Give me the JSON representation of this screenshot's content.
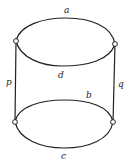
{
  "diagram": {
    "type": "graph",
    "colors": {
      "stroke": "#222222",
      "background": "#ffffff",
      "node_fill": "#ffffff"
    },
    "nodes": [
      {
        "id": "top-left",
        "x": 16,
        "y": 41
      },
      {
        "id": "top-right",
        "x": 115,
        "y": 44
      },
      {
        "id": "bottom-left",
        "x": 15,
        "y": 122
      },
      {
        "id": "bottom-right",
        "x": 113,
        "y": 122
      }
    ],
    "edges": [
      {
        "label": "a",
        "from": "top-left",
        "to": "top-right",
        "kind": "upper arc of top ellipse"
      },
      {
        "label": "d",
        "from": "top-left",
        "to": "top-right",
        "kind": "lower arc of top ellipse"
      },
      {
        "label": "p",
        "from": "top-left",
        "to": "bottom-left",
        "kind": "vertical line"
      },
      {
        "label": "q",
        "from": "top-right",
        "to": "bottom-right",
        "kind": "vertical line"
      },
      {
        "label": "b",
        "from": "bottom-left",
        "to": "bottom-right",
        "kind": "upper arc of bottom ellipse"
      },
      {
        "label": "c",
        "from": "bottom-left",
        "to": "bottom-right",
        "kind": "lower arc of bottom ellipse"
      }
    ],
    "labels": {
      "a": "a",
      "b": "b",
      "c": "c",
      "d": "d",
      "p": "p",
      "q": "q"
    }
  }
}
